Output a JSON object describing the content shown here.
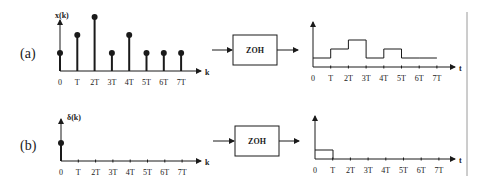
{
  "rows": [
    {
      "label": "(a)",
      "input_signal": {
        "ylabel": "x(k)",
        "xlabel": "k",
        "ticks": [
          "0",
          "T",
          "2T",
          "3T",
          "4T",
          "5T",
          "6T",
          "7T"
        ],
        "values": [
          1,
          2,
          3,
          1,
          2,
          1,
          1,
          1
        ]
      },
      "block": "ZOH",
      "output_signal": {
        "xlabel": "t",
        "ticks": [
          "0",
          "T",
          "2T",
          "3T",
          "4T",
          "5T",
          "6T",
          "7T"
        ],
        "levels": [
          1,
          2,
          3,
          1,
          2,
          1,
          1,
          1
        ]
      }
    },
    {
      "label": "(b)",
      "input_signal": {
        "ylabel": "δ(k)",
        "xlabel": "k",
        "ticks": [
          "0",
          "T",
          "2T",
          "3T",
          "4T",
          "5T",
          "6T",
          "7T"
        ],
        "values": [
          1,
          0,
          0,
          0,
          0,
          0,
          0,
          0
        ]
      },
      "block": "ZOH",
      "output_signal": {
        "xlabel": "t",
        "ticks": [
          "0",
          "T",
          "2T",
          "3T",
          "4T",
          "5T",
          "6T",
          "7T"
        ],
        "levels": [
          1,
          0,
          0,
          0,
          0,
          0,
          0,
          0
        ]
      }
    }
  ],
  "colors": {
    "ink": "#1a1a1a",
    "divider": "#9a9a9a"
  }
}
